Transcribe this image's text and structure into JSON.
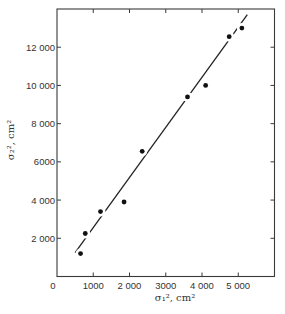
{
  "chart_data": {
    "type": "scatter",
    "title": "",
    "xlabel": "σ₁², cm²",
    "ylabel": "σ₂², cm²",
    "xlim": [
      0,
      6000
    ],
    "ylim": [
      0,
      14000
    ],
    "grid": false,
    "legend": null,
    "x_ticks": [
      0,
      1000,
      2000,
      3000,
      4000,
      5000
    ],
    "x_tick_labels": [
      "0",
      "1000",
      "2 000",
      "3000",
      "4 000",
      "5 000"
    ],
    "y_ticks": [
      2000,
      4000,
      6000,
      8000,
      10000,
      12000
    ],
    "y_tick_labels": [
      "2 000",
      "4 000",
      "6000",
      "8 000",
      "10 000",
      "12 000"
    ],
    "series": [
      {
        "name": "measurements",
        "kind": "scatter",
        "marker": "filled-circle",
        "x": [
          650,
          780,
          1200,
          1850,
          2350,
          3600,
          4100,
          4750,
          5100
        ],
        "y": [
          1200,
          2250,
          3400,
          3900,
          6550,
          9400,
          10000,
          12550,
          13000
        ]
      },
      {
        "name": "linear fit",
        "kind": "line",
        "x": [
          500,
          5250
        ],
        "y": [
          1250,
          13700
        ]
      }
    ]
  }
}
